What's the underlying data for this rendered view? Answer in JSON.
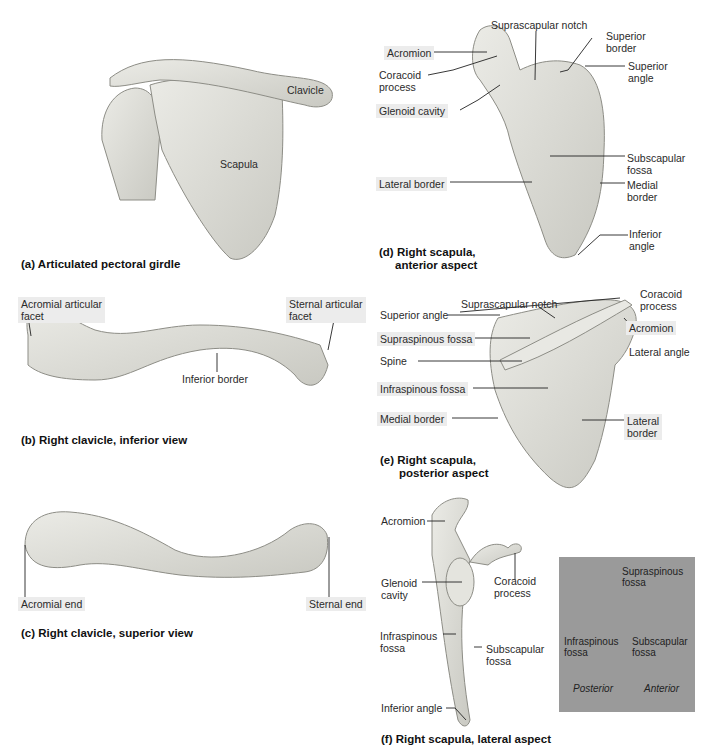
{
  "panels": {
    "a": {
      "caption": "(a) Articulated pectoral girdle",
      "labels": {
        "clavicle": "Clavicle",
        "scapula": "Scapula"
      }
    },
    "b": {
      "caption": "(b) Right clavicle, inferior view",
      "labels": {
        "acromial_facet_1": "Acromial articular",
        "acromial_facet_2": "facet",
        "sternal_facet_1": "Sternal articular",
        "sternal_facet_2": "facet",
        "inferior_border": "Inferior border"
      }
    },
    "c": {
      "caption": "(c) Right clavicle, superior view",
      "labels": {
        "acromial_end": "Acromial end",
        "sternal_end": "Sternal end"
      }
    },
    "d": {
      "caption_1": "(d) Right scapula,",
      "caption_2": "anterior aspect",
      "labels": {
        "suprascapular_notch": "Suprascapular notch",
        "superior_border_1": "Superior",
        "superior_border_2": "border",
        "acromion": "Acromion",
        "coracoid_1": "Coracoid",
        "coracoid_2": "process",
        "superior_angle_1": "Superior",
        "superior_angle_2": "angle",
        "glenoid_cavity": "Glenoid cavity",
        "subscapular_1": "Subscapular",
        "subscapular_2": "fossa",
        "lateral_border": "Lateral border",
        "medial_border_1": "Medial",
        "medial_border_2": "border",
        "inferior_angle_1": "Inferior",
        "inferior_angle_2": "angle"
      }
    },
    "e": {
      "caption_1": "(e)  Right scapula,",
      "caption_2": "posterior aspect",
      "labels": {
        "coracoid_1": "Coracoid",
        "coracoid_2": "process",
        "suprascapular_notch": "Suprascapular notch",
        "superior_angle": "Superior angle",
        "acromion": "Acromion",
        "supraspinous_fossa": "Supraspinous fossa",
        "lateral_angle": "Lateral angle",
        "spine": "Spine",
        "infraspinous_fossa": "Infraspinous fossa",
        "medial_border": "Medial border",
        "lateral_border_1": "Lateral",
        "lateral_border_2": "border"
      }
    },
    "f": {
      "caption": "(f)  Right scapula, lateral aspect",
      "labels": {
        "acromion": "Acromion",
        "glenoid_1": "Glenoid",
        "glenoid_2": "cavity",
        "coracoid_1": "Coracoid",
        "coracoid_2": "process",
        "infraspinous_1": "Infraspinous",
        "infraspinous_2": "fossa",
        "subscapular_1": "Subscapular",
        "subscapular_2": "fossa",
        "inferior_angle": "Inferior angle"
      }
    },
    "inset": {
      "background": "#9a9a9a",
      "supraspinous_1": "Supraspinous",
      "supraspinous_2": "fossa",
      "infraspinous_1": "Infraspinous",
      "infraspinous_2": "fossa",
      "subscapular_1": "Subscapular",
      "subscapular_2": "fossa",
      "posterior": "Posterior",
      "anterior": "Anterior"
    }
  },
  "colors": {
    "bone": "#dcdcd6",
    "bone_shadow": "#a9a9a2",
    "leader": "#222222"
  }
}
